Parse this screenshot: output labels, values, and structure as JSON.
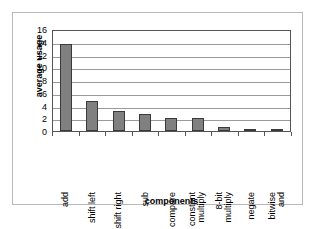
{
  "chart_data": {
    "type": "bar",
    "title": "",
    "xlabel": "components",
    "ylabel": "average usage",
    "categories": [
      "add",
      "shift left",
      "shift right",
      "sub",
      "compare",
      "constant multiply",
      "8-bit multiply",
      "negate",
      "bitwise and"
    ],
    "values": [
      13.7,
      4.7,
      3.2,
      2.6,
      2.1,
      2.0,
      0.6,
      0.3,
      0.3
    ],
    "ylim": [
      0,
      16
    ],
    "yticks": [
      0,
      2,
      4,
      6,
      8,
      10,
      12,
      14,
      16
    ],
    "ytick_labels": [
      "0",
      "2",
      "4",
      "6",
      "8",
      "10",
      "12",
      "14",
      "16"
    ],
    "grid": true,
    "grid_axis": "y",
    "legend": false,
    "bar_color": "#808080",
    "bar_edge_color": "#3a3a3a",
    "gridline_color": "#9a9a9a",
    "axis_color": "#555555",
    "background": "#ffffff"
  },
  "category_lines": [
    [
      "add"
    ],
    [
      "shift left"
    ],
    [
      "shift right"
    ],
    [
      "sub"
    ],
    [
      "compare"
    ],
    [
      "constant",
      "multiply"
    ],
    [
      "8-bit",
      "multiply"
    ],
    [
      "negate"
    ],
    [
      "bitwise",
      "and"
    ]
  ]
}
